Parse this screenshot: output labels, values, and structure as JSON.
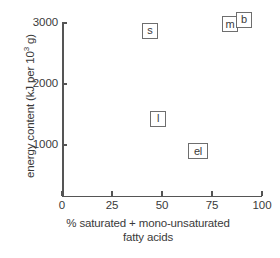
{
  "chart_data": {
    "type": "scatter",
    "title": "",
    "xlabel": "% saturated + mono-unsaturated fatty acids",
    "xlabel_line1": "% saturated + mono-unsaturated",
    "xlabel_line2": "fatty acids",
    "ylabel": "energy content (kJ per 10³ g)",
    "ylabel_prefix": "energy content (kJ per 10",
    "ylabel_sup": "3",
    "ylabel_suffix": " g)",
    "xlim": [
      0,
      100
    ],
    "ylim": [
      0,
      3100
    ],
    "xticks": [
      0,
      25,
      50,
      75,
      100
    ],
    "xtick_labels": [
      "0",
      "25",
      "50",
      "75",
      "100"
    ],
    "yticks": [
      1000,
      2000,
      3000
    ],
    "ytick_labels": [
      "1000",
      "2000",
      "3000"
    ],
    "grid": false,
    "legend": "none",
    "marker_style": "boxed-letter-label",
    "points": [
      {
        "label": "s",
        "x": 44,
        "y": 2870
      },
      {
        "label": "m",
        "x": 84,
        "y": 2980
      },
      {
        "label": "b",
        "x": 91,
        "y": 3050
      },
      {
        "label": "l",
        "x": 48,
        "y": 1430
      },
      {
        "label": "el",
        "x": 68,
        "y": 900
      }
    ]
  },
  "colors": {
    "axis": "#555555",
    "marker_border": "#6e6e6e",
    "marker_fill": "#ffffff",
    "text": "#3a3a3a",
    "background": "#ffffff"
  }
}
